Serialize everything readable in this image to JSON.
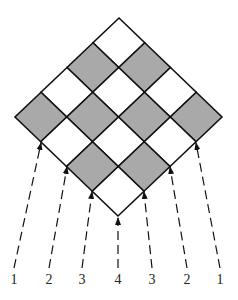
{
  "diagram": {
    "type": "checkerboard-diamond",
    "grid_size": 4,
    "colors": {
      "shaded": "#a9a9a9",
      "unshaded": "#ffffff",
      "line": "#111111"
    },
    "vertices": {
      "top": [
        119,
        18
      ],
      "right": [
        222,
        117
      ],
      "bottom": [
        118,
        216
      ],
      "left": [
        15,
        117
      ]
    },
    "shaded_rule": "odd",
    "arrows": [
      {
        "label": "1",
        "from": [
          14,
          268
        ],
        "to": [
          41,
          143
        ]
      },
      {
        "label": "2",
        "from": [
          49,
          268
        ],
        "to": [
          67,
          167
        ]
      },
      {
        "label": "3",
        "from": [
          82,
          268
        ],
        "to": [
          92,
          192
        ]
      },
      {
        "label": "4",
        "from": [
          118,
          268
        ],
        "to": [
          118,
          218
        ]
      },
      {
        "label": "3",
        "from": [
          152,
          268
        ],
        "to": [
          144,
          192
        ]
      },
      {
        "label": "2",
        "from": [
          187,
          268
        ],
        "to": [
          170,
          167
        ]
      },
      {
        "label": "1",
        "from": [
          220,
          268
        ],
        "to": [
          196,
          143
        ]
      }
    ],
    "labels": [
      "1",
      "2",
      "3",
      "4",
      "3",
      "2",
      "1"
    ]
  }
}
